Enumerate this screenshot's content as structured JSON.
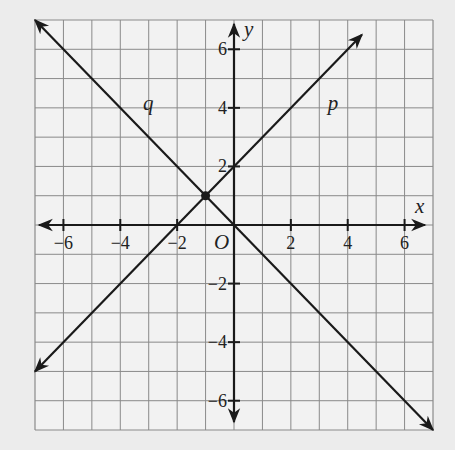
{
  "chart_data": {
    "type": "line",
    "title": "",
    "xlabel": "x",
    "ylabel": "y",
    "origin_label": "O",
    "xlim": [
      -7,
      7
    ],
    "ylim": [
      -7,
      7
    ],
    "grid": true,
    "x_ticks": [
      -6,
      -4,
      -2,
      2,
      4,
      6
    ],
    "y_ticks": [
      6,
      4,
      2,
      -2,
      -4,
      -6
    ],
    "x_tick_labels": [
      "−6",
      "−4",
      "−2",
      "2",
      "4",
      "6"
    ],
    "y_tick_labels": [
      "6",
      "4",
      "2",
      "−2",
      "−4",
      "−6"
    ],
    "series": [
      {
        "name": "p",
        "equation": "y = x + 2",
        "slope": 1,
        "intercept": 2,
        "points": [
          [
            -7,
            -5
          ],
          [
            4.5,
            6.5
          ]
        ],
        "label_pos": [
          3.3,
          4.2
        ]
      },
      {
        "name": "q",
        "equation": "y = -x",
        "slope": -1,
        "intercept": 0,
        "points": [
          [
            -7,
            7
          ],
          [
            7,
            -7
          ]
        ],
        "label_pos": [
          -3.2,
          4.2
        ]
      }
    ],
    "intersection": {
      "x": -1,
      "y": 1
    }
  }
}
